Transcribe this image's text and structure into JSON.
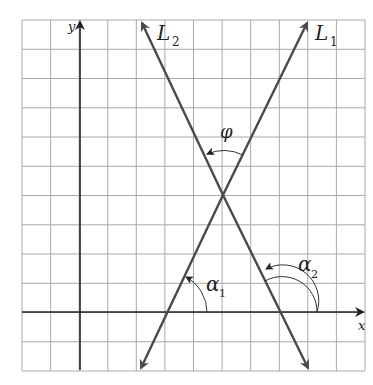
{
  "diagram": {
    "grid": {
      "columns": 12,
      "rows": 12,
      "color": "#a9a9a9"
    },
    "axes": {
      "x_label": "x",
      "y_label": "y",
      "origin_grid": {
        "col": 2,
        "row": 10
      }
    },
    "lines": [
      {
        "id": "L1",
        "label": "L",
        "subscript": "1",
        "x_intercept": 3,
        "through": [
          5,
          4
        ],
        "color": "#4a4a4a"
      },
      {
        "id": "L2",
        "label": "L",
        "subscript": "2",
        "x_intercept": 7,
        "through": [
          5,
          4
        ],
        "color": "#4a4a4a"
      }
    ],
    "intersection": [
      5,
      4
    ],
    "angles": [
      {
        "id": "alpha1",
        "symbol": "α",
        "subscript": "1",
        "description": "inclination of L1"
      },
      {
        "id": "alpha2",
        "symbol": "α",
        "subscript": "2",
        "description": "inclination of L2"
      },
      {
        "id": "phi",
        "symbol": "φ",
        "subscript": "",
        "description": "angle from L1 to L2"
      }
    ]
  }
}
